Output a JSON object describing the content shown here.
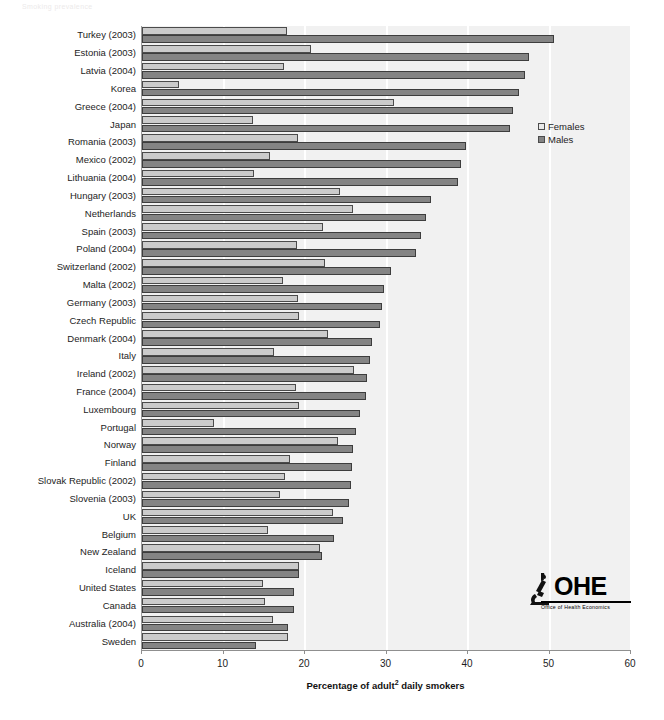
{
  "masthead": {
    "text": "Smoking prevalence"
  },
  "legend": {
    "position": "inside-top-right",
    "entries": [
      {
        "label": "Females",
        "color": "#e9e9e9",
        "swatch": "open-square-icon"
      },
      {
        "label": "Males",
        "color": "#848484",
        "swatch": "filled-square-icon"
      }
    ]
  },
  "logo": {
    "icon": "microscope-icon",
    "acronym": "OHE",
    "subtitle": "Office of Health Economics"
  },
  "axis": {
    "x_title_prefix": "Percentage of  adult",
    "x_title_sup": "2",
    "x_title_suffix": " daily smokers",
    "x_ticks": [
      "0",
      "10",
      "20",
      "30",
      "40",
      "50",
      "60"
    ]
  },
  "chart_data": {
    "type": "bar",
    "orientation": "horizontal",
    "title": "",
    "subtitle": "",
    "xlabel": "Percentage of adult² daily smokers",
    "ylabel": "",
    "xlim": [
      0,
      60
    ],
    "xticks": [
      0,
      10,
      20,
      30,
      40,
      50,
      60
    ],
    "grid": "vertical-white-gridlines",
    "legend_position": "inside-top-right",
    "categories": [
      "Turkey (2003)",
      "Estonia (2003)",
      "Latvia (2004)",
      "Korea",
      "Greece (2004)",
      "Japan",
      "Romania (2003)",
      "Mexico (2002)",
      "Lithuania (2004)",
      "Hungary (2003)",
      "Netherlands",
      "Spain (2003)",
      "Poland (2004)",
      "Switzerland (2002)",
      "Malta (2002)",
      "Germany (2003)",
      "Czech Republic",
      "Denmark (2004)",
      "Italy",
      "Ireland (2002)",
      "France (2004)",
      "Luxembourg",
      "Portugal",
      "Norway",
      "Finland",
      "Slovak Republic (2002)",
      "Slovenia (2003)",
      "UK",
      "Belgium",
      "New Zealand",
      "Iceland",
      "United States",
      "Canada",
      "Australia (2004)",
      "Sweden"
    ],
    "series": [
      {
        "name": "Females",
        "color": "#cbcbcb",
        "values": [
          17.8,
          20.7,
          17.4,
          4.6,
          30.9,
          13.6,
          19.1,
          15.7,
          13.7,
          24.3,
          25.9,
          22.2,
          19.0,
          22.5,
          17.3,
          19.1,
          19.3,
          22.8,
          16.2,
          26.0,
          18.9,
          19.3,
          8.8,
          24.0,
          18.1,
          17.6,
          16.9,
          23.4,
          15.5,
          21.9,
          19.3,
          14.9,
          15.1,
          16.1,
          17.9
        ]
      },
      {
        "name": "Males",
        "color": "#848484",
        "values": [
          50.6,
          47.5,
          47.0,
          46.3,
          45.5,
          45.2,
          39.7,
          39.1,
          38.8,
          35.5,
          34.8,
          34.2,
          33.6,
          30.6,
          29.7,
          29.5,
          29.2,
          28.2,
          28.0,
          27.6,
          27.5,
          26.7,
          26.2,
          25.9,
          25.8,
          25.7,
          25.4,
          24.7,
          23.6,
          22.1,
          19.3,
          18.7,
          18.6,
          17.9,
          14.0
        ]
      }
    ]
  },
  "style": {
    "plot_background": "#f1f1f1",
    "gridline_color": "#ffffff",
    "axis_color": "#8f8f8f",
    "text_color": "#1d1d1d"
  }
}
